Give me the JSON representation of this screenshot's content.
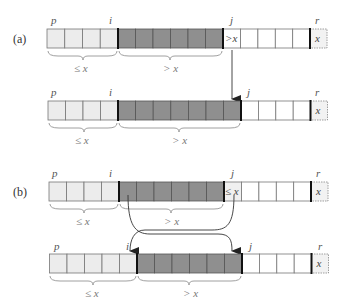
{
  "diagram": {
    "colors": {
      "le_region": "#ececec",
      "gt_region": "#8f8f8f",
      "unknown_region": "#ffffff",
      "pivot_cell": "#f0f0f0",
      "cell_border": "#666666",
      "thick_border": "#111111",
      "arrow": "#333333"
    },
    "cases": [
      {
        "label": "(a)",
        "before": {
          "indices": {
            "p": "p",
            "i": "i",
            "j": "j",
            "r": "r"
          },
          "le_count": 4,
          "gt_count": 6,
          "current_cell": ">x",
          "unknown_count": 4,
          "pivot": "x",
          "brace_le": "≤ x",
          "brace_gt": "> x"
        },
        "after": {
          "indices": {
            "p": "p",
            "i": "i",
            "j": "j",
            "r": "r"
          },
          "le_count": 4,
          "gt_count": 7,
          "unknown_count": 4,
          "pivot": "x",
          "brace_le": "≤ x",
          "brace_gt": "> x"
        }
      },
      {
        "label": "(b)",
        "before": {
          "indices": {
            "p": "p",
            "i": "i",
            "j": "j",
            "r": "r"
          },
          "le_count": 4,
          "gt_count": 6,
          "current_cell": "≤ x",
          "unknown_count": 4,
          "pivot": "x",
          "brace_le": "≤ x",
          "brace_gt": "> x"
        },
        "after": {
          "indices": {
            "p": "p",
            "i": "i",
            "j": "j",
            "r": "r"
          },
          "le_count": 5,
          "gt_count": 6,
          "unknown_count": 4,
          "pivot": "x",
          "brace_le": "≤ x",
          "brace_gt": "> x"
        }
      }
    ]
  }
}
